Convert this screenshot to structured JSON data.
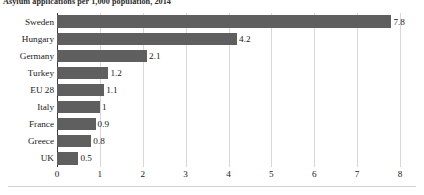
{
  "chart_data": {
    "type": "bar",
    "orientation": "horizontal",
    "title": "Asylum applications per 1,000 population, 2014",
    "xlabel": "",
    "ylabel": "",
    "xlim": [
      0,
      8
    ],
    "xticks": [
      "0",
      "1",
      "2",
      "3",
      "4",
      "5",
      "6",
      "7",
      "8"
    ],
    "grid": true,
    "legend": false,
    "bar_color": "#5f5f5f",
    "categories": [
      "Sweden",
      "Hungary",
      "Germany",
      "Turkey",
      "EU 28",
      "Italy",
      "France",
      "Greece",
      "UK"
    ],
    "values": [
      7.8,
      4.2,
      2.1,
      1.2,
      1.1,
      1,
      0.9,
      0.8,
      0.5
    ],
    "value_labels": [
      "7.8",
      "4.2",
      "2.1",
      "1.2",
      "1.1",
      "1",
      "0.9",
      "0.8",
      "0.5"
    ]
  }
}
